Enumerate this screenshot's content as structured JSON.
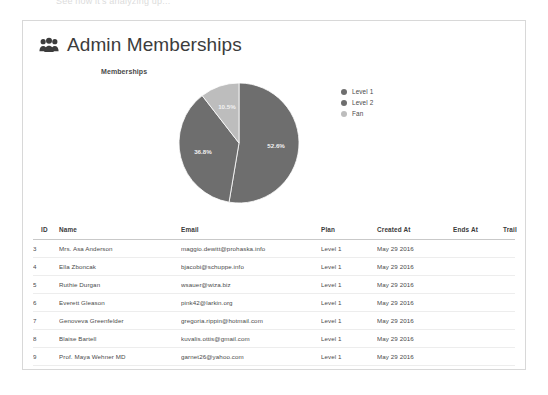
{
  "top_ghost_text": "See how it's analyzing up...",
  "header": {
    "icon": "users-icon",
    "title": "Admin Memberships"
  },
  "chart_data": {
    "type": "pie",
    "title": "Memberships",
    "categories": [
      "Level 1",
      "Level 2",
      "Fan"
    ],
    "values": [
      52.6,
      36.8,
      10.5
    ],
    "value_labels": [
      "52.6%",
      "36.8%",
      "10.5%"
    ],
    "colors": [
      "#6e6e6e",
      "#6e6e6e",
      "#bdbdbd"
    ],
    "legend_position": "right",
    "grid": false,
    "units": "percent"
  },
  "table": {
    "columns": [
      {
        "key": "id",
        "label": "ID"
      },
      {
        "key": "name",
        "label": "Name"
      },
      {
        "key": "email",
        "label": "Email"
      },
      {
        "key": "plan",
        "label": "Plan"
      },
      {
        "key": "created_at",
        "label": "Created At"
      },
      {
        "key": "ends_at",
        "label": "Ends At"
      },
      {
        "key": "trail",
        "label": "Trail"
      }
    ],
    "rows": [
      {
        "id": "3",
        "name": "Mrs. Asa Anderson",
        "email": "maggio.dewitt@prohaska.info",
        "plan": "Level 1",
        "created_at": "May 29 2016",
        "ends_at": "",
        "trail": ""
      },
      {
        "id": "4",
        "name": "Ella Zboncak",
        "email": "bjacobi@schuppe.info",
        "plan": "Level 1",
        "created_at": "May 29 2016",
        "ends_at": "",
        "trail": ""
      },
      {
        "id": "5",
        "name": "Ruthie Durgan",
        "email": "wsauer@wiza.biz",
        "plan": "Level 1",
        "created_at": "May 29 2016",
        "ends_at": "",
        "trail": ""
      },
      {
        "id": "6",
        "name": "Everett Gleason",
        "email": "pink42@larkin.org",
        "plan": "Level 1",
        "created_at": "May 29 2016",
        "ends_at": "",
        "trail": ""
      },
      {
        "id": "7",
        "name": "Genoveva Greenfelder",
        "email": "gregoria.rippin@hotmail.com",
        "plan": "Level 1",
        "created_at": "May 29 2016",
        "ends_at": "",
        "trail": ""
      },
      {
        "id": "8",
        "name": "Blaise Bartell",
        "email": "kuvalis.ottis@gmail.com",
        "plan": "Level 1",
        "created_at": "May 29 2016",
        "ends_at": "",
        "trail": ""
      },
      {
        "id": "9",
        "name": "Prof. Maya Wehner MD",
        "email": "garnet26@yahoo.com",
        "plan": "Level 1",
        "created_at": "May 29 2016",
        "ends_at": "",
        "trail": ""
      },
      {
        "id": "10",
        "name": "Barbara Rogahn",
        "email": "raina43@barrows.com",
        "plan": "Level 1",
        "created_at": "May 29 2016",
        "ends_at": "",
        "trail": ""
      }
    ]
  }
}
